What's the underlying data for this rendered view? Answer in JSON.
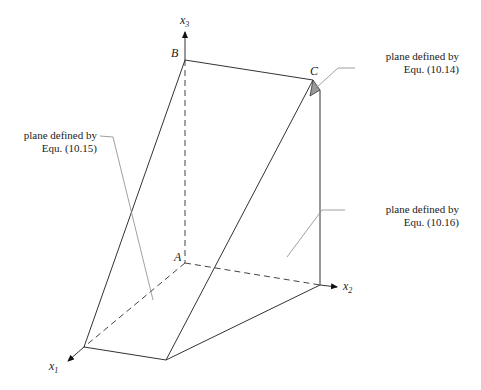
{
  "figure": {
    "axes": {
      "x1": {
        "name": "x",
        "sub": "1"
      },
      "x2": {
        "name": "x",
        "sub": "2"
      },
      "x3": {
        "name": "x",
        "sub": "3"
      }
    },
    "points": {
      "A": "A",
      "B": "B",
      "C": "C"
    },
    "annotations": [
      {
        "line1": "plane defined by",
        "line2": "Equ. (10.14)"
      },
      {
        "line1": "plane defined by",
        "line2": "Equ. (10.15)"
      },
      {
        "line1": "plane defined by",
        "line2": "Equ. (10.16)"
      }
    ],
    "colors": {
      "shaded_plane": "#999999",
      "lines": "#333333"
    }
  }
}
